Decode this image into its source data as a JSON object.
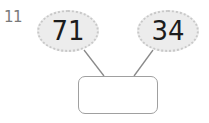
{
  "question": {
    "number": "11",
    "parts": [
      "71",
      "34"
    ],
    "whole": ""
  },
  "colors": {
    "oval_fill": "#ececec",
    "oval_border": "#c8c8c8",
    "line": "#8a8a8a",
    "box_border": "#a0a0a0",
    "number_label": "#7a7a7a"
  }
}
